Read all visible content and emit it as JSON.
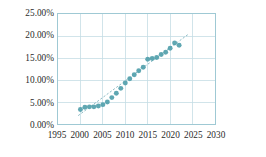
{
  "chart_data": {
    "type": "scatter",
    "title": "",
    "subtitle": "",
    "xlabel": "",
    "ylabel": "",
    "xlim": [
      1995,
      2030
    ],
    "ylim": [
      0,
      25
    ],
    "grid": true,
    "legend": null,
    "y_tick_labels": [
      "0.00%",
      "5.00%",
      "10.00%",
      "15.00%",
      "20.00%",
      "25.00%"
    ],
    "y_tick_values": [
      0,
      5,
      10,
      15,
      20,
      25
    ],
    "x_tick_labels": [
      "1995",
      "2000",
      "2005",
      "2010",
      "2015",
      "2020",
      "2025",
      "2030"
    ],
    "x_tick_values": [
      1995,
      2000,
      2005,
      2010,
      2015,
      2020,
      2025,
      2030
    ],
    "marker_color": "#51a0ab",
    "gridline_color": "#c5dde4",
    "frame_color": "#9fc9d4",
    "trendline_color": "#7fb3bd",
    "series": [
      {
        "name": "data",
        "x": [
          2000,
          2001,
          2002,
          2003,
          2004,
          2005,
          2006,
          2007,
          2008,
          2009,
          2010,
          2011,
          2012,
          2013,
          2014,
          2015,
          2016,
          2017,
          2018,
          2019,
          2020,
          2021,
          2022
        ],
        "values": [
          3.3,
          3.8,
          3.9,
          3.9,
          4.1,
          4.4,
          5.0,
          6.0,
          7.0,
          8.1,
          9.3,
          10.3,
          11.2,
          12.1,
          12.9,
          14.7,
          14.9,
          15.1,
          15.8,
          16.3,
          17.2,
          18.4,
          17.9
        ]
      }
    ],
    "trendline": {
      "type": "linear",
      "x_start": 1999.5,
      "y_start": 1.9,
      "x_end": 2024.2,
      "y_end": 20.5
    }
  }
}
